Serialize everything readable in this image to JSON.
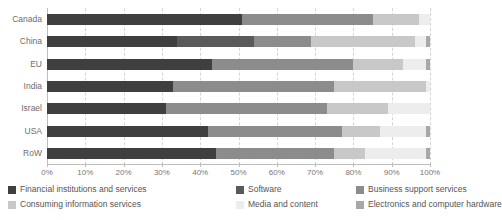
{
  "chart_data": {
    "type": "bar",
    "subtype": "stacked-horizontal-100pct",
    "title": "",
    "subtitle": "",
    "xlabel": "",
    "ylabel": "",
    "xlim": [
      0,
      100
    ],
    "xticks": [
      "0%",
      "10%",
      "20%",
      "30%",
      "40%",
      "50%",
      "60%",
      "70%",
      "80%",
      "90%",
      "100%"
    ],
    "xtick_values": [
      0,
      10,
      20,
      30,
      40,
      50,
      60,
      70,
      80,
      90,
      100
    ],
    "grid": true,
    "grid_axis": "x",
    "grid_style": "dashed",
    "legend_position": "bottom",
    "categories": [
      "Canada",
      "China",
      "EU",
      "India",
      "Israel",
      "USA",
      "RoW"
    ],
    "series": [
      {
        "name": "Financial institutions and services",
        "color": "#3f3f3f",
        "values": [
          51,
          34,
          43,
          33,
          31,
          42,
          44
        ]
      },
      {
        "name": "Software",
        "color": "#5a5a5a",
        "values": [
          0,
          20,
          0,
          0,
          0,
          0,
          0
        ]
      },
      {
        "name": "Business support services",
        "color": "#8c8c8c",
        "values": [
          34,
          15,
          37,
          42,
          42,
          35,
          31
        ]
      },
      {
        "name": "Consuming information services",
        "color": "#c8c8c8",
        "values": [
          12,
          27,
          13,
          24,
          16,
          10,
          8
        ]
      },
      {
        "name": "Media and content",
        "color": "#ededed",
        "values": [
          3,
          3,
          6,
          1,
          11,
          12,
          16
        ]
      },
      {
        "name": "Electronics and computer hardware",
        "color": "#a8a8a8",
        "values": [
          0,
          1,
          1,
          0,
          0,
          1,
          1
        ]
      }
    ],
    "legend_entries": [
      "Financial institutions and services",
      "Software",
      "Business support services",
      "Consuming information services",
      "Media and content",
      "Electronics and computer hardware"
    ]
  },
  "colors": {
    "background": "#ffffff",
    "axis": "#bdbdbd",
    "grid": "#d4d4d4",
    "tick_text": "#777777",
    "label_text": "#6e6e6e",
    "legend_text": "#555555"
  }
}
